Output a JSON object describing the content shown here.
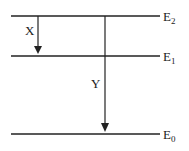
{
  "diagram": {
    "type": "energy-level-diagram",
    "levels": [
      {
        "name": "E",
        "sub": "2",
        "y": 16
      },
      {
        "name": "E",
        "sub": "1",
        "y": 56
      },
      {
        "name": "E",
        "sub": "0",
        "y": 134
      }
    ],
    "transitions": [
      {
        "label": "X",
        "from": "E2",
        "to": "E1"
      },
      {
        "label": "Y",
        "from": "E2",
        "to": "E0"
      }
    ]
  }
}
